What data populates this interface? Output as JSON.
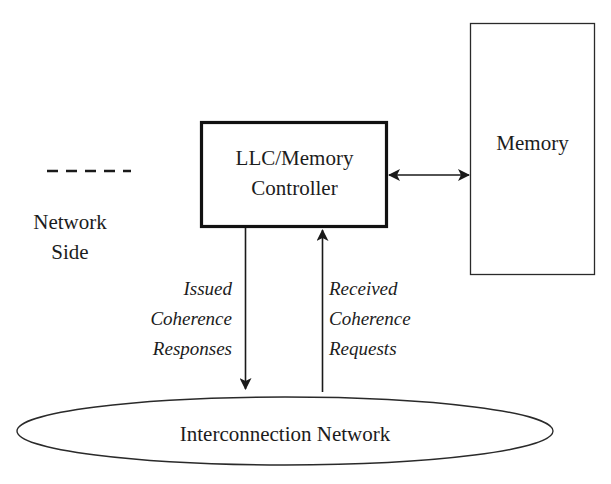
{
  "diagram": {
    "nodes": {
      "llc_controller": {
        "label_line1": "LLC/Memory",
        "label_line2": "Controller"
      },
      "memory": {
        "label": "Memory"
      },
      "interconnect": {
        "label": "Interconnection Network"
      }
    },
    "legend": {
      "line_style": "dashed",
      "label_line1": "Network",
      "label_line2": "Side"
    },
    "edges": {
      "issued_responses": {
        "direction": "controller-to-network",
        "label_line1": "Issued",
        "label_line2": "Coherence",
        "label_line3": "Responses"
      },
      "received_requests": {
        "direction": "network-to-controller",
        "label_line1": "Received",
        "label_line2": "Coherence",
        "label_line3": "Requests"
      },
      "controller_memory": {
        "direction": "bidirectional"
      }
    },
    "colors": {
      "stroke": "#1a1a1a",
      "background": "#ffffff"
    }
  }
}
